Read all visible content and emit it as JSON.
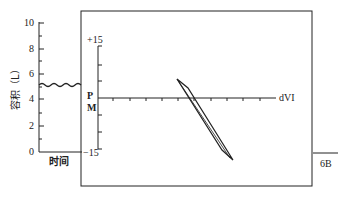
{
  "left_panel": {
    "y_label": "容积（L）",
    "x_label": "时间",
    "y_ticks": [
      "10",
      "8",
      "6",
      "4",
      "2",
      "0"
    ]
  },
  "right_panel": {
    "y_top": "+15",
    "y_bottom": "−15",
    "y_label_p": "P",
    "y_label_m": "M",
    "x_label": "dVI"
  },
  "figure_label": "6B",
  "colors": {
    "ink": "#222222",
    "background": "#ffffff"
  }
}
